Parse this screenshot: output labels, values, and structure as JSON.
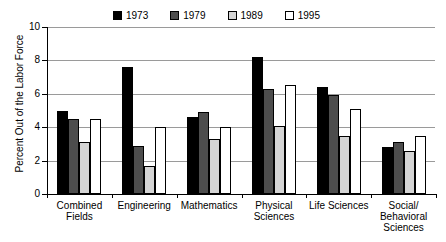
{
  "chart_data": {
    "type": "bar",
    "title": "",
    "subtitle": "",
    "xlabel": "",
    "ylabel": "Percent Out of the Labor Force",
    "ylim": [
      0,
      10
    ],
    "yticks": [
      0,
      2,
      4,
      6,
      8,
      10
    ],
    "ytick_labels": [
      "0",
      "2",
      "4",
      "6",
      "8",
      "10"
    ],
    "grid": true,
    "legend_position": "top",
    "categories": [
      "Combined\nFields",
      "Engineering",
      "Mathematics",
      "Physical\nSciences",
      "Life Sciences",
      "Social/\nBehavioral\nSciences"
    ],
    "series": [
      {
        "name": "1973",
        "color": "#000000",
        "values": [
          5.0,
          7.6,
          4.6,
          8.2,
          6.4,
          2.8
        ]
      },
      {
        "name": "1979",
        "color": "#4d4d4d",
        "values": [
          4.5,
          2.9,
          4.9,
          6.3,
          5.9,
          3.1
        ]
      },
      {
        "name": "1989",
        "color": "#d4d4d4",
        "values": [
          3.1,
          1.7,
          3.3,
          4.1,
          3.5,
          2.6
        ]
      },
      {
        "name": "1995",
        "color": "#ffffff",
        "values": [
          4.5,
          4.0,
          4.0,
          6.5,
          5.1,
          3.5
        ]
      }
    ]
  }
}
